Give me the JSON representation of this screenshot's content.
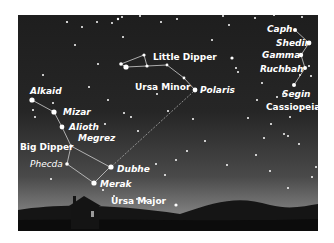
{
  "figure": {
    "colors": {
      "sky_top": "#1e1e1e",
      "sky_bottom": "#8a8a8a",
      "ground": "#0f0f0f",
      "star": "#ffffff",
      "line": "#cfcfcf"
    },
    "constellations": [
      {
        "name": "Big Dipper",
        "parent": "Ursa Major",
        "stars": [
          "Alkaid",
          "Mizar",
          "Alioth",
          "Megrez",
          "Phecda",
          "Merak",
          "Dubhe"
        ]
      },
      {
        "name": "Little Dipper",
        "parent": "Ursa Minor",
        "stars": [
          "Polaris"
        ]
      },
      {
        "name": "Cassiopeia",
        "stars": [
          "Caph",
          "Shedir",
          "Gamma",
          "Ruchbah",
          "Segin"
        ]
      }
    ],
    "labels": {
      "alkaid": "Alkaid",
      "mizar": "Mizar",
      "alioth": "Alioth",
      "megrez": "Megrez",
      "big_dipper": "Big Dipper",
      "phecda": "Phecda",
      "dubhe": "Dubhe",
      "merak": "Merak",
      "ursa_major": "Ursa Major",
      "little_dipper": "Little Dipper",
      "ursa_minor": "Ursa Minor",
      "polaris": "Polaris",
      "caph": "Caph",
      "shedir": "Shedir",
      "gamma": "Gamma",
      "ruchbah": "Ruchbah",
      "segin": "Segin",
      "cassiopeia": "Cassiopeia"
    }
  }
}
